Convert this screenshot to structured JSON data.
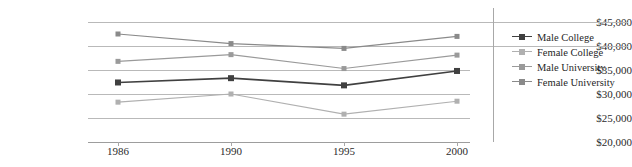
{
  "chart_data": {
    "type": "line",
    "title": "",
    "xlabel": "",
    "ylabel": "",
    "categories": [
      "1986",
      "1990",
      "1995",
      "2000"
    ],
    "ylim": [
      20000,
      45000
    ],
    "ytick_values": [
      20000,
      25000,
      30000,
      35000,
      40000,
      45000
    ],
    "ytick_labels": [
      "$20,000",
      "$25,000",
      "$30,000",
      "$35,000",
      "$40,000",
      "$45,000"
    ],
    "grid": true,
    "legend_position": "right",
    "series": [
      {
        "name": "Male College",
        "color": "#404040",
        "values": [
          32400,
          33300,
          31800,
          34800
        ]
      },
      {
        "name": "Female College",
        "color": "#b0b0b0",
        "values": [
          28300,
          30000,
          25800,
          28500
        ]
      },
      {
        "name": "Male University",
        "color": "#9a9a9a",
        "values": [
          36800,
          38200,
          35300,
          38100
        ]
      },
      {
        "name": "Female University",
        "color": "#8a8a8a",
        "values": [
          42500,
          40500,
          39500,
          42000
        ]
      }
    ]
  },
  "axis": {
    "ytick_labels": [
      "$45,000",
      "$40,000",
      "$35,000",
      "$30,000",
      "$25,000",
      "$20,000"
    ],
    "xtick_labels": [
      "1986",
      "1990",
      "1995",
      "2000"
    ]
  },
  "legend": {
    "items": [
      {
        "label": "Male College"
      },
      {
        "label": "Female College"
      },
      {
        "label": "Male University"
      },
      {
        "label": "Female University"
      }
    ]
  }
}
